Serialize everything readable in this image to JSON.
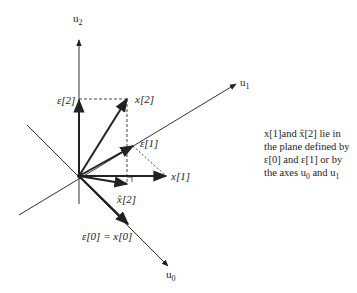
{
  "diagram": {
    "axes": [
      {
        "name": "u0",
        "label": "u",
        "sub": "0"
      },
      {
        "name": "u1",
        "label": "u",
        "sub": "1"
      },
      {
        "name": "u2",
        "label": "u",
        "sub": "2"
      }
    ],
    "vectors": {
      "eps2": "ε[2]",
      "x2": "x[2]",
      "eps1": "ε[1]",
      "x1": "x[1]",
      "xhat2": "x̂[2]",
      "eps0": "ε[0] = x[0]"
    },
    "caption": {
      "line1": "x[1]and x̂[2] lie in",
      "line2": "the plane defined by",
      "line3": "ε[0] and ε[1] or by",
      "line4_prefix": "the axes u",
      "line4_sub0": "0",
      "line4_mid": " and u",
      "line4_sub1": "1"
    },
    "colors": {
      "ink": "#222222",
      "background": "#ffffff"
    }
  }
}
